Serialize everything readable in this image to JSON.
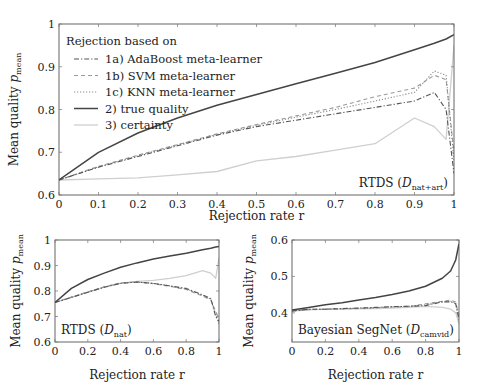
{
  "chart_data": [
    {
      "type": "line",
      "panel": "main",
      "annotation": "RTDS (D_nat+art)",
      "annotation_main": "RTDS (",
      "annotation_sym": "D",
      "annotation_sub": "nat+art",
      "annotation_close": ")",
      "xlabel": "Rejection rate r",
      "ylabel": "Mean quality p",
      "ylabel_sub": "mean",
      "xlim": [
        0,
        1
      ],
      "ylim": [
        0.6,
        1.0
      ],
      "xticks": [
        "0",
        "0.1",
        "0.2",
        "0.3",
        "0.4",
        "0.5",
        "0.6",
        "0.7",
        "0.8",
        "0.9",
        "1"
      ],
      "yticks": [
        "0.6",
        "0.7",
        "0.8",
        "0.9",
        "1"
      ],
      "grid": false,
      "legend": {
        "title": "Rejection based on",
        "position": "upper left",
        "entries": [
          {
            "label": "1a) AdaBoost meta-learner",
            "style": "dashdot",
            "color": "#555555"
          },
          {
            "label": "1b) SVM meta-learner",
            "style": "dashed",
            "color": "#999999"
          },
          {
            "label": "1c) KNN meta-learner",
            "style": "dotted",
            "color": "#888888"
          },
          {
            "label": "2) true quality",
            "style": "solid",
            "color": "#444444"
          },
          {
            "label": "3) certainty",
            "style": "solid",
            "color": "#cccccc"
          }
        ]
      },
      "x": [
        0,
        0.1,
        0.2,
        0.3,
        0.4,
        0.5,
        0.6,
        0.7,
        0.8,
        0.9,
        0.95,
        0.98,
        1.0
      ],
      "series": [
        {
          "name": "1a) AdaBoost meta-learner",
          "values": [
            0.635,
            0.665,
            0.69,
            0.715,
            0.74,
            0.76,
            0.775,
            0.79,
            0.805,
            0.82,
            0.84,
            0.8,
            0.65
          ]
        },
        {
          "name": "1b) SVM meta-learner",
          "values": [
            0.635,
            0.667,
            0.693,
            0.718,
            0.743,
            0.765,
            0.785,
            0.805,
            0.83,
            0.85,
            0.88,
            0.87,
            0.7
          ]
        },
        {
          "name": "1c) KNN meta-learner",
          "values": [
            0.635,
            0.666,
            0.692,
            0.717,
            0.742,
            0.763,
            0.782,
            0.8,
            0.82,
            0.84,
            0.89,
            0.88,
            0.68
          ]
        },
        {
          "name": "2) true quality",
          "values": [
            0.635,
            0.7,
            0.745,
            0.78,
            0.81,
            0.835,
            0.86,
            0.885,
            0.91,
            0.94,
            0.955,
            0.965,
            0.975
          ]
        },
        {
          "name": "3) certainty",
          "values": [
            0.635,
            0.638,
            0.64,
            0.647,
            0.655,
            0.68,
            0.69,
            0.705,
            0.72,
            0.78,
            0.76,
            0.73,
            0.95
          ]
        }
      ]
    },
    {
      "type": "line",
      "panel": "bottom-left",
      "annotation": "RTDS (D_nat)",
      "annotation_main": "RTDS (",
      "annotation_sym": "D",
      "annotation_sub": "nat",
      "annotation_close": ")",
      "xlabel": "Rejection rate r",
      "ylabel": "Mean quality p",
      "ylabel_sub": "mean",
      "xlim": [
        0,
        1
      ],
      "ylim": [
        0.6,
        1.0
      ],
      "xticks": [
        "0",
        "0.2",
        "0.4",
        "0.6",
        "0.8",
        "1"
      ],
      "yticks": [
        "0.6",
        "0.7",
        "0.8",
        "0.9",
        "1"
      ],
      "x": [
        0,
        0.1,
        0.2,
        0.3,
        0.4,
        0.5,
        0.6,
        0.7,
        0.8,
        0.9,
        0.95,
        0.98,
        1.0
      ],
      "series": [
        {
          "name": "1a) AdaBoost meta-learner",
          "values": [
            0.755,
            0.775,
            0.795,
            0.815,
            0.83,
            0.835,
            0.83,
            0.82,
            0.81,
            0.785,
            0.77,
            0.7,
            0.68
          ]
        },
        {
          "name": "1b) SVM meta-learner",
          "values": [
            0.755,
            0.776,
            0.797,
            0.816,
            0.832,
            0.836,
            0.829,
            0.818,
            0.806,
            0.78,
            0.765,
            0.72,
            0.69
          ]
        },
        {
          "name": "1c) KNN meta-learner",
          "values": [
            0.755,
            0.775,
            0.796,
            0.815,
            0.831,
            0.835,
            0.83,
            0.82,
            0.808,
            0.783,
            0.768,
            0.71,
            0.67
          ]
        },
        {
          "name": "2) true quality",
          "values": [
            0.755,
            0.81,
            0.845,
            0.87,
            0.893,
            0.91,
            0.925,
            0.937,
            0.948,
            0.962,
            0.968,
            0.972,
            0.975
          ]
        },
        {
          "name": "3) certainty",
          "values": [
            0.755,
            0.775,
            0.795,
            0.815,
            0.83,
            0.838,
            0.842,
            0.85,
            0.86,
            0.88,
            0.87,
            0.85,
            0.93
          ]
        }
      ]
    },
    {
      "type": "line",
      "panel": "bottom-right",
      "annotation": "Bayesian SegNet (D_camvid)",
      "annotation_main": "Bayesian SegNet (",
      "annotation_sym": "D",
      "annotation_sub": "camvid",
      "annotation_close": ")",
      "xlabel": "Rejection rate r",
      "ylabel": "Mean quality p",
      "ylabel_sub": "mean",
      "xlim": [
        0,
        1
      ],
      "ylim": [
        0.32,
        0.6
      ],
      "xticks": [
        "0",
        "0.2",
        "0.4",
        "0.6",
        "0.8",
        "1"
      ],
      "yticks": [
        "0.4",
        "0.5",
        "0.6"
      ],
      "x": [
        0,
        0.1,
        0.2,
        0.3,
        0.4,
        0.5,
        0.6,
        0.7,
        0.8,
        0.9,
        0.95,
        0.98,
        1.0
      ],
      "series": [
        {
          "name": "1a) AdaBoost meta-learner",
          "values": [
            0.405,
            0.41,
            0.41,
            0.412,
            0.413,
            0.415,
            0.417,
            0.418,
            0.42,
            0.43,
            0.43,
            0.425,
            0.38
          ]
        },
        {
          "name": "1b) SVM meta-learner",
          "values": [
            0.405,
            0.409,
            0.41,
            0.411,
            0.412,
            0.414,
            0.416,
            0.417,
            0.425,
            0.432,
            0.435,
            0.43,
            0.39
          ]
        },
        {
          "name": "1c) KNN meta-learner",
          "values": [
            0.405,
            0.41,
            0.41,
            0.411,
            0.413,
            0.414,
            0.417,
            0.418,
            0.422,
            0.43,
            0.432,
            0.428,
            0.385
          ]
        },
        {
          "name": "2) true quality",
          "values": [
            0.408,
            0.415,
            0.422,
            0.428,
            0.435,
            0.442,
            0.45,
            0.46,
            0.473,
            0.495,
            0.515,
            0.545,
            0.59
          ]
        },
        {
          "name": "3) certainty",
          "values": [
            0.405,
            0.408,
            0.41,
            0.41,
            0.411,
            0.412,
            0.413,
            0.415,
            0.418,
            0.415,
            0.41,
            0.4,
            0.37
          ]
        }
      ]
    }
  ]
}
